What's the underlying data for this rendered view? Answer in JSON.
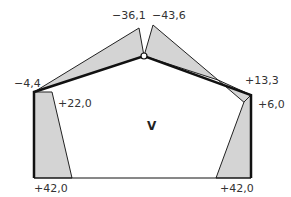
{
  "diagram": {
    "type": "bending-moment-diagram",
    "structure": "three-hinged frame with sloped roof",
    "colors": {
      "fill": "#d4d4d4",
      "outline": "#222222",
      "frame": "#111111",
      "text": "#333333"
    },
    "center_label": "V",
    "values": {
      "left_eave": "−4,4",
      "apex_left": "−36,1",
      "apex_right": "−43,6",
      "right_eave_roof": "+13,3",
      "left_column_top": "+22,0",
      "right_column_top": "+6,0",
      "left_base": "+42,0",
      "right_base": "+42,0"
    }
  }
}
